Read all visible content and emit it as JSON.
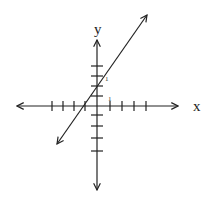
{
  "diagram": {
    "type": "coordinate-plane-line-graph",
    "axes": {
      "x_label": "x",
      "y_label": "y",
      "x_ticks_left": 4,
      "x_ticks_right": 4,
      "y_ticks_up": 3,
      "y_ticks_down": 4,
      "tick_labels": [
        "1",
        "1"
      ]
    },
    "line": {
      "equation": "y = 2x + 2",
      "slope": 2,
      "y_intercept": 2,
      "x_intercept": -1,
      "arrows": "both-ends"
    },
    "colors": {
      "stroke": "#222222",
      "background": "#ffffff"
    }
  }
}
